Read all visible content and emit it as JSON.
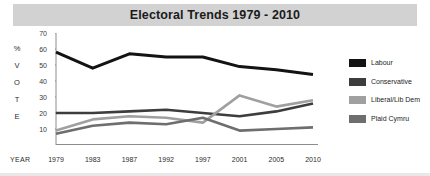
{
  "chart_title": "Electoral Trends 1979 - 2010",
  "axes": {
    "y_axis_letters": [
      "%",
      "V",
      "O",
      "T",
      "E"
    ],
    "y_tick_labels": [
      "70",
      "60",
      "50",
      "40",
      "30",
      "20",
      "10"
    ],
    "x_axis_label": "YEAR"
  },
  "legend": {
    "items": [
      {
        "label": "Labour",
        "color": "#131313"
      },
      {
        "label": "Conservative",
        "color": "#3d3d3d"
      },
      {
        "label": "Liberal/Lib Dem",
        "color": "#a0a0a0"
      },
      {
        "label": "Plaid Cymru",
        "color": "#6e6e6e"
      }
    ]
  },
  "chart_data": {
    "type": "line",
    "title": "Electoral Trends 1979 - 2010",
    "xlabel": "YEAR",
    "ylabel": "% VOTE",
    "categories": [
      "1979",
      "1983",
      "1987",
      "1992",
      "1997",
      "2001",
      "2005",
      "2010"
    ],
    "x": [
      1979,
      1983,
      1987,
      1992,
      1997,
      2001,
      2005,
      2010
    ],
    "ylim": [
      0,
      70
    ],
    "xlim": [
      1979,
      2010
    ],
    "yticks": [
      10,
      20,
      30,
      40,
      50,
      60,
      70
    ],
    "grid": false,
    "legend_position": "right",
    "series": [
      {
        "name": "Labour",
        "color": "#131313",
        "values": [
          58,
          48,
          57,
          55,
          55,
          49,
          47,
          44
        ]
      },
      {
        "name": "Conservative",
        "color": "#3d3d3d",
        "values": [
          20,
          20,
          21,
          22,
          20,
          18,
          21,
          26
        ]
      },
      {
        "name": "Liberal/Lib Dem",
        "color": "#a0a0a0",
        "values": [
          9,
          16,
          18,
          17,
          14,
          31,
          24,
          28
        ]
      },
      {
        "name": "Plaid Cymru",
        "color": "#6e6e6e",
        "values": [
          7,
          12,
          14,
          13,
          17,
          9,
          10,
          11
        ]
      }
    ]
  }
}
